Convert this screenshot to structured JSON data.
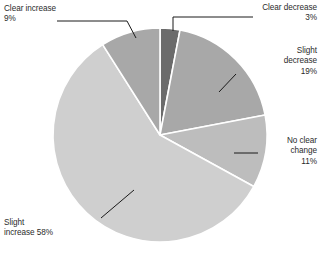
{
  "chart_data": {
    "type": "pie",
    "title": "",
    "xlabel": "",
    "ylabel": "",
    "legend_position": "none",
    "grid": false,
    "units": "percent",
    "categories": [
      "Clear decrease",
      "Slight decrease",
      "No clear change",
      "Slight increase",
      "Clear increase"
    ],
    "values": [
      3,
      19,
      11,
      58,
      9
    ],
    "slices": [
      {
        "label": "Clear decrease",
        "value": 3,
        "value_label": "3%",
        "text": "Clear decrease\n3%",
        "color": "#6b6b6b",
        "start_angle_deg": 0,
        "end_angle_deg": 10.8,
        "callout_align": "right"
      },
      {
        "label": "Slight decrease",
        "value": 19,
        "value_label": "19%",
        "text": "Slight\ndecrease\n19%",
        "color": "#a8a8a8",
        "start_angle_deg": 10.8,
        "end_angle_deg": 79.2,
        "callout_align": "right"
      },
      {
        "label": "No clear change",
        "value": 11,
        "value_label": "11%",
        "text": "No clear\nchange\n11%",
        "color": "#bdbdbd",
        "start_angle_deg": 79.2,
        "end_angle_deg": 118.8,
        "callout_align": "right"
      },
      {
        "label": "Slight increase",
        "value": 58,
        "value_label": "58%",
        "text": "Slight\nincrease 58%",
        "color": "#cfcfcf",
        "start_angle_deg": 118.8,
        "end_angle_deg": 327.6,
        "callout_align": "left"
      },
      {
        "label": "Clear increase",
        "value": 9,
        "value_label": "9%",
        "text": "Clear increase\n9%",
        "color": "#a8a8a8",
        "start_angle_deg": 327.6,
        "end_angle_deg": 360,
        "callout_align": "left"
      }
    ],
    "geometry": {
      "center_x": 160,
      "center_y": 135,
      "radius": 107,
      "slice_border_color": "#ffffff",
      "leader_line_color": "#1a1a1a",
      "background": "#ffffff"
    }
  }
}
